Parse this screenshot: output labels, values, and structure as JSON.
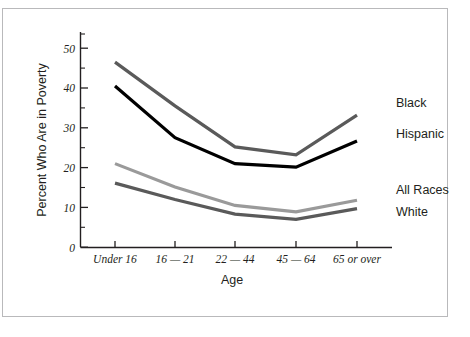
{
  "figure": {
    "background_color": "#ffffff",
    "frame_color": "#b9b9bb"
  },
  "chart_data": {
    "type": "line",
    "title": "",
    "xlabel": "Age",
    "ylabel": "Percent Who Are in Poverty",
    "categories": [
      "Under 16",
      "16 — 21",
      "22 — 44",
      "45 — 64",
      "65 or over"
    ],
    "ylim": [
      0,
      50
    ],
    "yticks": [
      0,
      10,
      20,
      30,
      40,
      50
    ],
    "ytick_labels": [
      "0",
      "10",
      "20",
      "30",
      "40",
      "50"
    ],
    "yminor_ticks": [
      5,
      15,
      25,
      35,
      45,
      52
    ],
    "grid": false,
    "legend_position": "right-inline",
    "series": [
      {
        "name": "Black",
        "color": "#5a5a5a",
        "values": [
          46.5,
          35.5,
          25.2,
          23.2,
          33.2
        ]
      },
      {
        "name": "Hispanic",
        "color": "#000000",
        "values": [
          40.5,
          27.5,
          21.0,
          20.1,
          26.7
        ]
      },
      {
        "name": "All Races",
        "color": "#9a9a9a",
        "values": [
          21.0,
          15.1,
          10.5,
          8.9,
          11.8
        ]
      },
      {
        "name": "White",
        "color": "#5a5a5a",
        "values": [
          16.1,
          12.0,
          8.3,
          7.0,
          9.7
        ]
      }
    ]
  },
  "labels": {
    "black": "Black",
    "hispanic": "Hispanic",
    "all_races": "All Races",
    "white": "White",
    "y_axis_title": "Percent Who Are in Poverty",
    "x_axis_title": "Age",
    "y_0": "0",
    "y_10": "10",
    "y_20": "20",
    "y_30": "30",
    "y_40": "40",
    "y_50": "50",
    "cat_0": "Under 16",
    "cat_1": "16 — 21",
    "cat_2": "22 — 44",
    "cat_3": "45 — 64",
    "cat_4": "65 or over"
  }
}
